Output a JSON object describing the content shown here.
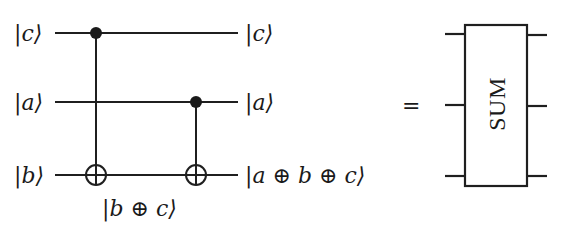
{
  "circuit": {
    "inputs": [
      {
        "label": "|c⟩",
        "var": "c"
      },
      {
        "label": "|a⟩",
        "var": "a"
      },
      {
        "label": "|b⟩",
        "var": "b"
      }
    ],
    "outputs": [
      {
        "label": "|c⟩"
      },
      {
        "label": "|a⟩"
      },
      {
        "label": "|a ⊕ b ⊕ c⟩"
      }
    ],
    "intermediate_label": "|b ⊕ c⟩",
    "gates": [
      {
        "type": "CNOT",
        "control": "c",
        "target": "b"
      },
      {
        "type": "CNOT",
        "control": "a",
        "target": "b"
      }
    ]
  },
  "equals_sign": "=",
  "block": {
    "label": "SUM",
    "inputs": 3,
    "outputs": 3
  }
}
